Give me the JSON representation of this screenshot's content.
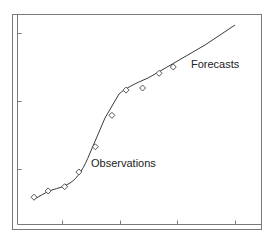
{
  "chart_data": {
    "type": "line",
    "title": "",
    "xlabel": "",
    "ylabel": "",
    "grid": false,
    "legend": "none",
    "annotations": [
      {
        "text": "Observations",
        "x_px": 91,
        "y_px": 157
      },
      {
        "text": "Forecasts",
        "x_px": 191,
        "y_px": 58
      }
    ],
    "x_tick_labels": [],
    "y_tick_labels": [],
    "xlim": [
      0,
      1
    ],
    "ylim": [
      0,
      1
    ],
    "series": [
      {
        "name": "Observations",
        "style": "markers",
        "marker": "diamond",
        "x": [
          0.07,
          0.13,
          0.2,
          0.26,
          0.33,
          0.4,
          0.46,
          0.53,
          0.6,
          0.66
        ],
        "y": [
          0.13,
          0.16,
          0.18,
          0.25,
          0.37,
          0.52,
          0.64,
          0.65,
          0.72,
          0.75
        ]
      },
      {
        "name": "Fitted / Forecast line",
        "style": "line",
        "x": [
          0.07,
          0.13,
          0.2,
          0.26,
          0.33,
          0.4,
          0.46,
          0.53,
          0.6,
          0.66,
          0.86,
          0.97
        ],
        "y": [
          0.13,
          0.17,
          0.19,
          0.26,
          0.39,
          0.55,
          0.64,
          0.68,
          0.71,
          0.75,
          0.86,
          0.95
        ]
      }
    ]
  },
  "plot": {
    "frame_color": "#7a7a7a",
    "line_color": "#3a3a3a",
    "marker_color": "#555555",
    "observations_label": "Observations",
    "forecasts_label": "Forecasts"
  }
}
